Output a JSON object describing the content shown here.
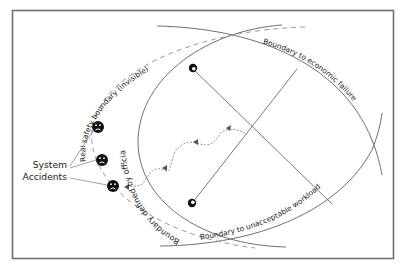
{
  "diagram": {
    "title": "",
    "labels": {
      "real_safety_boundary": "Real safety boundary (invisible)",
      "official_boundary": "Boundary defined by official work practices",
      "economic_failure": "Boundary to economic failure",
      "unacceptable_workload": "Boundary to unacceptable workload",
      "system_accidents_line1": "System",
      "system_accidents_line2": "Accidents"
    },
    "icons": {
      "sad_face_count": 3,
      "start_markers": [
        "top-left-marker",
        "bottom-left-marker"
      ]
    },
    "colors": {
      "line": "#707070",
      "dashed": "#9a9a9a",
      "face": "#111111",
      "text": "#222222",
      "background": "#ffffff"
    }
  }
}
